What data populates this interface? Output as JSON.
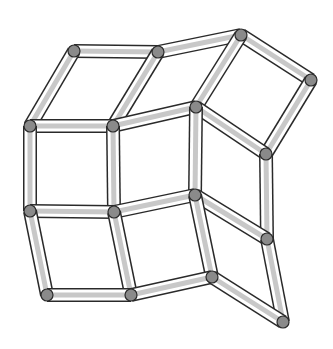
{
  "diagram": {
    "title": "",
    "canvas": {
      "width": 333,
      "height": 349,
      "background": "#ffffff"
    },
    "style": {
      "rod_outline_color": "#2a2a2a",
      "rod_fill_color": "#ffffff",
      "rod_shade_color": "#c8c8c8",
      "rod_width": 12,
      "node_fill_color": "#8a8a8a",
      "node_stroke_color": "#2a2a2a",
      "node_radius": 6
    },
    "nodes": [
      {
        "id": "A",
        "x": 74,
        "y": 51
      },
      {
        "id": "B",
        "x": 158,
        "y": 52
      },
      {
        "id": "C",
        "x": 241,
        "y": 35
      },
      {
        "id": "D",
        "x": 311,
        "y": 80
      },
      {
        "id": "E",
        "x": 30,
        "y": 126
      },
      {
        "id": "F",
        "x": 113,
        "y": 126
      },
      {
        "id": "G",
        "x": 196,
        "y": 107
      },
      {
        "id": "H",
        "x": 266,
        "y": 154
      },
      {
        "id": "I",
        "x": 30,
        "y": 211
      },
      {
        "id": "J",
        "x": 114,
        "y": 212
      },
      {
        "id": "K",
        "x": 195,
        "y": 195
      },
      {
        "id": "L",
        "x": 267,
        "y": 239
      },
      {
        "id": "M",
        "x": 47,
        "y": 295
      },
      {
        "id": "N",
        "x": 131,
        "y": 295
      },
      {
        "id": "O",
        "x": 212,
        "y": 277
      },
      {
        "id": "P",
        "x": 283,
        "y": 322
      }
    ],
    "edges": [
      [
        "A",
        "B"
      ],
      [
        "B",
        "C"
      ],
      [
        "C",
        "D"
      ],
      [
        "A",
        "E"
      ],
      [
        "B",
        "F"
      ],
      [
        "C",
        "G"
      ],
      [
        "D",
        "H"
      ],
      [
        "E",
        "F"
      ],
      [
        "F",
        "G"
      ],
      [
        "G",
        "H"
      ],
      [
        "E",
        "I"
      ],
      [
        "F",
        "J"
      ],
      [
        "G",
        "K"
      ],
      [
        "H",
        "L"
      ],
      [
        "I",
        "J"
      ],
      [
        "J",
        "K"
      ],
      [
        "K",
        "L"
      ],
      [
        "I",
        "M"
      ],
      [
        "J",
        "N"
      ],
      [
        "K",
        "O"
      ],
      [
        "L",
        "P"
      ],
      [
        "M",
        "N"
      ],
      [
        "N",
        "O"
      ],
      [
        "O",
        "P"
      ]
    ]
  }
}
